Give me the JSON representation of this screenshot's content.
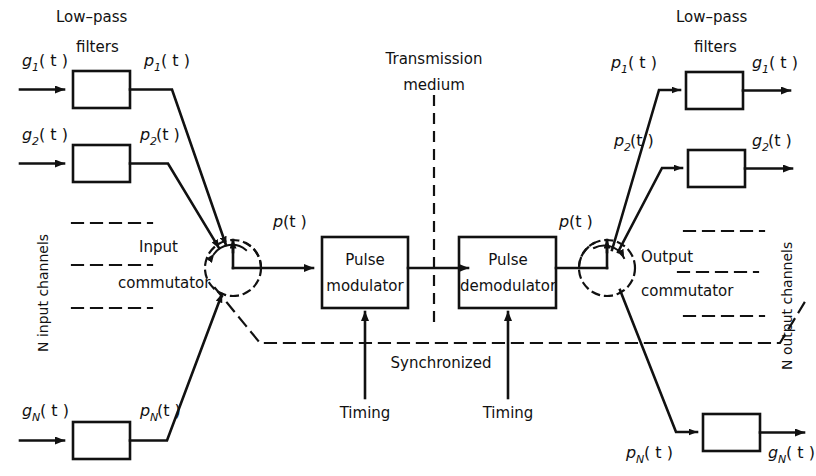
{
  "diagram": {
    "stroke_color": "#111111",
    "background": "#ffffff"
  },
  "headers": {
    "left_lowpass": "Low–pass",
    "left_filters": "filters",
    "right_lowpass": "Low–pass",
    "right_filters": "filters"
  },
  "center": {
    "transmission_line1": "Transmission",
    "transmission_line2": "medium",
    "synchronized": "Synchronized",
    "timing_left": "Timing",
    "timing_right": "Timing"
  },
  "blocks": {
    "pulse_modulator_line1": "Pulse",
    "pulse_modulator_line2": "modulator",
    "pulse_demodulator_line1": "Pulse",
    "pulse_demodulator_line2": "demodulator"
  },
  "commutators": {
    "input_line1": "Input",
    "input_line2": "commutator",
    "output_line1": "Output",
    "output_line2": "commutator"
  },
  "channels": {
    "left_vertical": "N input channels",
    "right_vertical": "N output channels"
  },
  "signals": {
    "p_of_t_left": "p",
    "p_of_t_right": "p",
    "paren_t": "( t )",
    "paren_t_tight": "(t )"
  },
  "left_inputs": [
    {
      "g_base": "g",
      "g_sub": "1",
      "p_base": "p",
      "p_sub": "1"
    },
    {
      "g_base": "g",
      "g_sub": "2",
      "p_base": "p",
      "p_sub": "2"
    },
    {
      "g_base": "g",
      "g_sub": "N",
      "p_base": "p",
      "p_sub": "N"
    }
  ],
  "right_outputs": [
    {
      "p_base": "p",
      "p_sub": "1",
      "g_base": "g",
      "g_sub": "1"
    },
    {
      "p_base": "p",
      "p_sub": "2",
      "g_base": "g",
      "g_sub": "2"
    },
    {
      "p_base": "p",
      "p_sub": "N",
      "g_base": "g",
      "g_sub": "N"
    }
  ]
}
